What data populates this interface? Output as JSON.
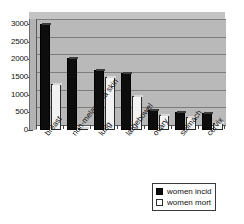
{
  "chart_data": {
    "type": "bar",
    "title": "",
    "subtitle": "",
    "xlabel": "",
    "ylabel": "",
    "ylim": [
      0,
      3000
    ],
    "yticks": [
      0,
      500,
      1000,
      1500,
      2000,
      2500,
      3000
    ],
    "ytick_labels": [
      "0",
      "500",
      "1000",
      "1500",
      "2000",
      "2500",
      "3000"
    ],
    "grid": true,
    "legend_position": "bottom-right",
    "categories": [
      "breast",
      "non-melanoma skin",
      "lung",
      "largebowel",
      "ovary",
      "stomach",
      "cervix"
    ],
    "series": [
      {
        "name": "women incid",
        "color": "#0d0d0d",
        "values": [
          3000,
          2050,
          1700,
          1620,
          580,
          500,
          480
        ]
      },
      {
        "name": "women mort",
        "color": "#ffffff",
        "values": [
          1300,
          50,
          1500,
          960,
          430,
          380,
          190
        ]
      }
    ]
  },
  "legend": {
    "items": [
      {
        "label": "women incid",
        "swatch": "filled-black-square"
      },
      {
        "label": "women mort",
        "swatch": "outlined-white-square"
      }
    ]
  },
  "colors": {
    "plot_background": "#b9b9b9",
    "page_background": "#ffffff",
    "gridline": "#7d7d7d",
    "axis": "#5a5a5a",
    "incidence_bar": "#0d0d0d",
    "mortality_bar": "#f2f2f2"
  }
}
